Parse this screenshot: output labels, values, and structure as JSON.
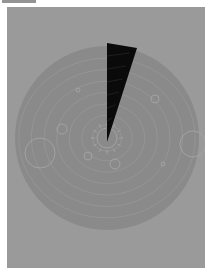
{
  "scene": {
    "type": "solar-system-reveal",
    "background_color": "#9a9a9a",
    "disc_color": "#8a8a8a",
    "line_color": "#a8a8a8",
    "wedge_color": "#0a0a0a",
    "disc": {
      "cx": 100,
      "cy": 131,
      "r": 92
    },
    "wedge": {
      "apex": [
        100,
        135
      ],
      "p1": [
        100,
        36
      ],
      "p2": [
        130,
        41
      ]
    },
    "orbit_radii": [
      14,
      24,
      36,
      48,
      60,
      72,
      84
    ],
    "sun": {
      "cx": 100,
      "cy": 131,
      "r": 10
    },
    "planets": [
      {
        "cx": 33,
        "cy": 146,
        "r": 15
      },
      {
        "cx": 55,
        "cy": 122,
        "r": 5
      },
      {
        "cx": 81,
        "cy": 149,
        "r": 4
      },
      {
        "cx": 108,
        "cy": 157,
        "r": 5
      },
      {
        "cx": 148,
        "cy": 92,
        "r": 4
      },
      {
        "cx": 186,
        "cy": 137,
        "r": 13
      },
      {
        "cx": 156,
        "cy": 157,
        "r": 2
      },
      {
        "cx": 71,
        "cy": 83,
        "r": 2
      }
    ]
  }
}
